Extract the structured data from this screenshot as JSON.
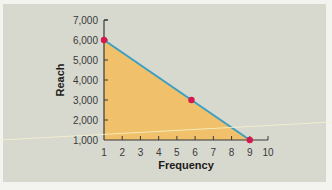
{
  "chart_data": {
    "type": "line",
    "title": "",
    "xlabel": "Frequency",
    "ylabel": "Reach",
    "x_ticks": [
      "1",
      "2",
      "3",
      "4",
      "5",
      "6",
      "7",
      "8",
      "9",
      "10"
    ],
    "y_ticks": [
      "1,000",
      "2,000",
      "3,000",
      "4,000",
      "5,000",
      "6,000",
      "7,000"
    ],
    "xlim": [
      1,
      10
    ],
    "ylim": [
      1000,
      7000
    ],
    "grid": false,
    "legend": null,
    "series": [
      {
        "name": "Reach vs Frequency",
        "points": [
          {
            "x": 1,
            "y": 6000
          },
          {
            "x": 5.8,
            "y": 3000
          },
          {
            "x": 9,
            "y": 1000
          }
        ],
        "line_color": "#3a9fc4",
        "marker_color": "#d4184e",
        "fill_under": true,
        "fill_color": "#f0c06a"
      }
    ]
  },
  "colors": {
    "panel_background": "#d7d8ce",
    "page_background": "#f3f3ef",
    "axis": "#3a3a3a"
  }
}
